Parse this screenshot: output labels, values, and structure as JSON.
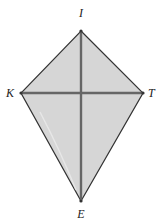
{
  "diagram": {
    "type": "kite",
    "vertices": [
      {
        "name": "I",
        "x": 81,
        "y": 31,
        "label_x": 81,
        "label_y": 17,
        "anchor": "middle"
      },
      {
        "name": "K",
        "x": 21,
        "y": 93,
        "label_x": 14,
        "label_y": 97,
        "anchor": "end"
      },
      {
        "name": "T",
        "x": 143,
        "y": 93,
        "label_x": 148,
        "label_y": 97,
        "anchor": "start"
      },
      {
        "name": "E",
        "x": 81,
        "y": 201,
        "label_x": 81,
        "label_y": 218,
        "anchor": "middle"
      }
    ],
    "diagonals": [
      {
        "from": "I",
        "to": "E"
      },
      {
        "from": "K",
        "to": "T"
      }
    ],
    "colors": {
      "fill": "#d6d6d6",
      "edge": "#333333",
      "diagonal": "#666666"
    }
  },
  "labels": {
    "I": "I",
    "K": "K",
    "T": "T",
    "E": "E"
  }
}
